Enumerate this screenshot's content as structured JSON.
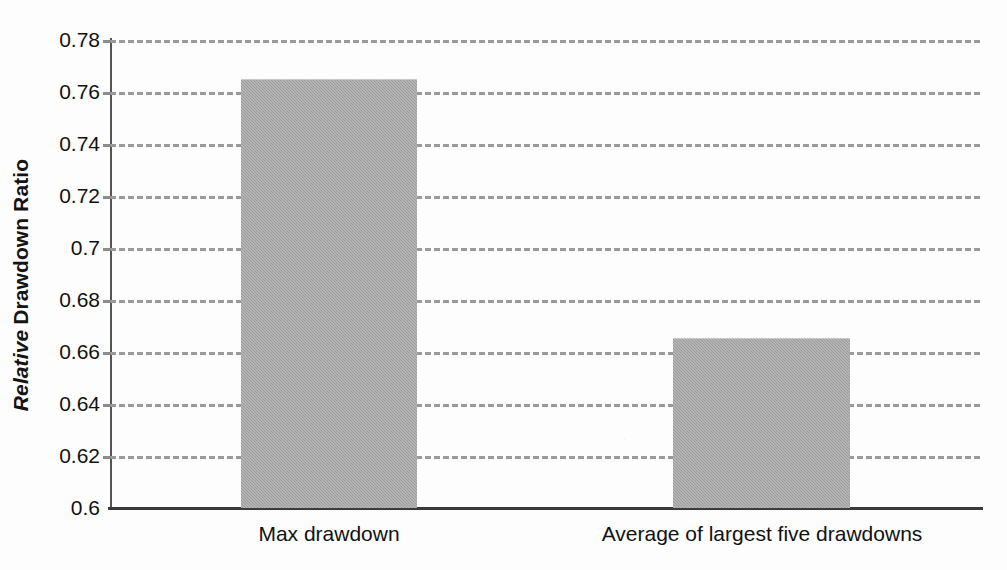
{
  "chart_data": {
    "type": "bar",
    "title": "",
    "subtitle": "",
    "xlabel": "",
    "ylabel": "Relative Drawdown Ratio",
    "ylabel_parts": {
      "italic": "Relative",
      "bold": "Drawdown Ratio"
    },
    "categories": [
      "Max drawdown",
      "Average of largest five drawdowns"
    ],
    "values": [
      0.765,
      0.6655
    ],
    "series": [
      {
        "name": "Relative Drawdown Ratio",
        "values": [
          0.765,
          0.6655
        ]
      }
    ],
    "ylim": [
      0.6,
      0.78
    ],
    "ytick_step": 0.02,
    "ytick_labels": [
      "0.78",
      "0.76",
      "0.74",
      "0.72",
      "0.7",
      "0.68",
      "0.66",
      "0.64",
      "0.62",
      "0.6"
    ],
    "ytick_values": [
      0.78,
      0.76,
      0.74,
      0.72,
      0.7,
      0.68,
      0.66,
      0.64,
      0.62,
      0.6
    ],
    "grid": true,
    "grid_style": "dashed",
    "legend": false,
    "legend_position": "none",
    "bar_color": "#9d9d9d",
    "grid_color": "#9a9a9a",
    "axis_color": "#3a3a3a",
    "text_color": "#111111",
    "background_color": "#fdfdfd"
  }
}
